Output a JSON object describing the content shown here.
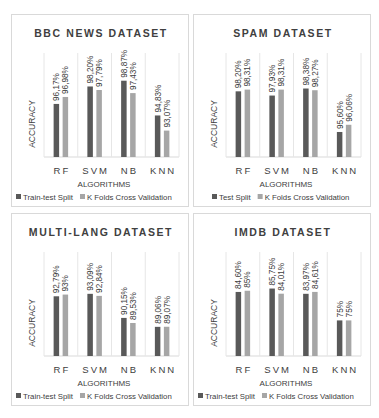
{
  "colors": {
    "series1": "#595959",
    "series2": "#a6a6a6",
    "grid": "#d9d9d9"
  },
  "chart_data": [
    {
      "type": "bar",
      "title": "BBC NEWS DATASET",
      "xlabel": "ALGORITHMS",
      "ylabel": "ACCURACY",
      "categories": [
        "RF",
        "SVM",
        "NB",
        "KNN"
      ],
      "ylim": [
        90,
        100
      ],
      "legend_position": "bottom",
      "series": [
        {
          "name": "Train-test Split",
          "values": [
            96.17,
            98.2,
            98.87,
            94.83
          ],
          "labels": [
            "96,17%",
            "98,20%",
            "98,87%",
            "94,83%"
          ]
        },
        {
          "name": "K Folds Cross Validation",
          "values": [
            96.98,
            97.79,
            97.43,
            93.07
          ],
          "labels": [
            "96,98%",
            "97,79%",
            "97,43%",
            "93,07%"
          ]
        }
      ]
    },
    {
      "type": "bar",
      "title": "SPAM DATASET",
      "xlabel": "ALGORITHMS",
      "ylabel": "ACCURACY",
      "categories": [
        "RF",
        "SVM",
        "NB",
        "KNN"
      ],
      "ylim": [
        94,
        99.5
      ],
      "legend_position": "bottom",
      "series": [
        {
          "name": "Test Split",
          "values": [
            98.2,
            97.93,
            98.38,
            95.6
          ],
          "labels": [
            "98,20%",
            "97,93%",
            "98,38%",
            "95,60%"
          ]
        },
        {
          "name": "K Folds Cross Validation",
          "values": [
            98.31,
            98.31,
            98.27,
            96.06
          ],
          "labels": [
            "98,31%",
            "98,31%",
            "98,27%",
            "96,06%"
          ]
        }
      ]
    },
    {
      "type": "bar",
      "title": "MULTI-LANG DATASET",
      "xlabel": "ALGORITHMS",
      "ylabel": "ACCURACY",
      "categories": [
        "RF",
        "SVM",
        "NB",
        "KNN"
      ],
      "ylim": [
        85.5,
        96
      ],
      "legend_position": "bottom",
      "series": [
        {
          "name": "Train-test Split",
          "values": [
            92.79,
            93.09,
            90.15,
            89.06
          ],
          "labels": [
            "92,79%",
            "93,09%",
            "90,15%",
            "89,06%"
          ]
        },
        {
          "name": "K Folds Cross Validation",
          "values": [
            93.0,
            92.84,
            89.53,
            89.07
          ],
          "labels": [
            "93%",
            "92,84%",
            "89,53%",
            "89,07%"
          ]
        }
      ]
    },
    {
      "type": "bar",
      "title": "IMDB DATASET",
      "xlabel": "ALGORITHMS",
      "ylabel": "ACCURACY",
      "categories": [
        "RF",
        "SVM",
        "NB",
        "KNN"
      ],
      "ylim": [
        63,
        92
      ],
      "legend_position": "bottom",
      "series": [
        {
          "name": "Train-test Split",
          "values": [
            84.6,
            85.75,
            83.97,
            75.0
          ],
          "labels": [
            "84,60%",
            "85,75%",
            "83,97%",
            "75%"
          ]
        },
        {
          "name": "K Folds Cross Validation",
          "values": [
            85.0,
            84.01,
            84.61,
            75.0
          ],
          "labels": [
            "85%",
            "84,01%",
            "84,61%",
            "75%"
          ]
        }
      ]
    }
  ]
}
